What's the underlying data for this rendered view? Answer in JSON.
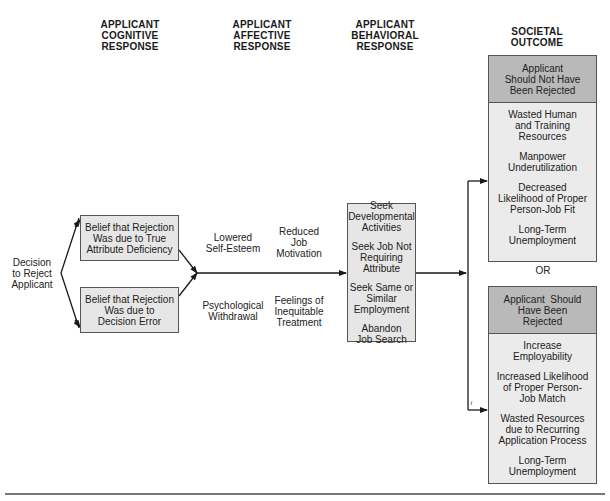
{
  "headers": {
    "cognitive": [
      "APPLICANT",
      "COGNITIVE",
      "RESPONSE"
    ],
    "affective": [
      "APPLICANT",
      "AFFECTIVE",
      "RESPONSE"
    ],
    "behavioral": [
      "APPLICANT",
      "BEHAVIORAL",
      "RESPONSE"
    ],
    "societal": [
      "SOCIETAL",
      "OUTCOME"
    ]
  },
  "start": {
    "label": [
      "Decision",
      "to Reject",
      "Applicant"
    ]
  },
  "cognitive": {
    "top_box": [
      "Belief that Rejection",
      "Was due to True",
      "Attribute Deficiency"
    ],
    "bottom_box": [
      "Belief that Rejection",
      "Was due to",
      "Decision Error"
    ]
  },
  "affective": {
    "top_left": [
      "Lowered",
      "Self-Esteem"
    ],
    "top_right": [
      "Reduced",
      "Job",
      "Motivation"
    ],
    "bottom_left": [
      "Psychological",
      "Withdrawal"
    ],
    "bottom_right": [
      "Feelings of",
      "Inequitable",
      "Treatment"
    ]
  },
  "behavioral": {
    "items": [
      [
        "Seek",
        "Developmental",
        "Activities"
      ],
      [
        "Seek Job Not",
        "Requiring Attribute"
      ],
      [
        "Seek Same or",
        "Similar Employment"
      ],
      [
        "Abandon",
        "Job Search"
      ]
    ]
  },
  "outcomes": {
    "or_label": "OR",
    "not_rejected": {
      "title": [
        "Applicant",
        "Should Not Have",
        "Been Rejected"
      ],
      "items": [
        [
          "Wasted Human",
          "and Training",
          "Resources"
        ],
        [
          "Manpower",
          "Underutilization"
        ],
        [
          "Decreased",
          "Likelihood of Proper",
          "Person-Job Fit"
        ],
        [
          "Long-Term",
          "Unemployment"
        ]
      ]
    },
    "rejected": {
      "title": [
        "Applicant  Should",
        "Have Been",
        "Rejected"
      ],
      "items": [
        [
          "Increase",
          "Employability"
        ],
        [
          "Increased Likelihood",
          "of Proper Person-",
          "Job Match"
        ],
        [
          "Wasted Resources",
          "due to Recurring",
          "Application Process"
        ],
        [
          "Long-Term",
          "Unemployment"
        ]
      ]
    }
  },
  "colors": {
    "box_fill": "#e6e6e6",
    "header_fill": "#b9b9b9",
    "line": "#1a1a1a"
  }
}
